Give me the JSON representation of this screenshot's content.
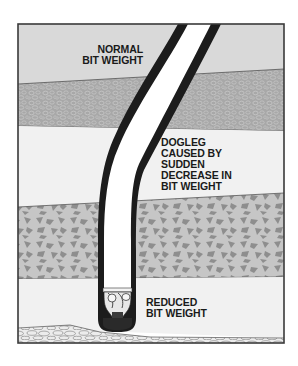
{
  "diagram": {
    "title": "Dogleg caused by sudden decrease in bit weight",
    "colors": {
      "background": "#ffffff",
      "frame": "#3a3a3a",
      "layer_top": "#d9d9d9",
      "layer_gravel": "#a9a9a9",
      "layer_light": "#f0f0f0",
      "layer_rock": "#c4c4c4",
      "rock_chunks": "#8f8f8f",
      "layer_cobble": "#e6e6e6",
      "pipe_wall": "#1c1c1c",
      "pipe_bore": "#ffffff"
    },
    "layers": [
      {
        "name": "top-formation",
        "pattern": "plain-light-gray"
      },
      {
        "name": "gravel-formation",
        "pattern": "fine-gravel-dark-gray"
      },
      {
        "name": "soft-formation",
        "pattern": "plain-very-light"
      },
      {
        "name": "hard-rock-formation",
        "pattern": "angular-rock-chunks"
      },
      {
        "name": "lower-soft-formation",
        "pattern": "plain-very-light"
      },
      {
        "name": "cobble-formation",
        "pattern": "rounded-cobbles"
      }
    ],
    "labels": {
      "normal": {
        "line1": "NORMAL",
        "line2": "BIT WEIGHT"
      },
      "dogleg": {
        "line1": "DOGLEG",
        "line2": "CAUSED BY",
        "line3": "SUDDEN",
        "line4": "DECREASE IN",
        "line5": "BIT WEIGHT"
      },
      "reduced": {
        "line1": "REDUCED",
        "line2": "BIT WEIGHT"
      }
    },
    "elements": {
      "borehole": "curved-borehole-with-drill-pipe",
      "bit": "drill-bit-icon"
    }
  }
}
